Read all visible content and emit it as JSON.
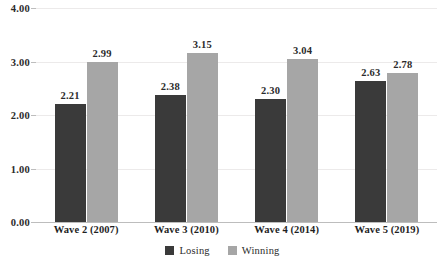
{
  "chart_data": {
    "type": "bar",
    "title": "",
    "subtitle": "",
    "xlabel": "",
    "ylabel": "",
    "ylim": [
      0,
      4
    ],
    "ytick_labels": [
      "0.00",
      "1.00",
      "2.00",
      "3.00",
      "4.00"
    ],
    "ytick_values": [
      0,
      1,
      2,
      3,
      4
    ],
    "grid": true,
    "grid_axis": "y",
    "legend_position": "bottom-center",
    "categories": [
      "Wave 2 (2007)",
      "Wave 3 (2010)",
      "Wave 4 (2014)",
      "Wave 5 (2019)"
    ],
    "series": [
      {
        "name": "Losing",
        "color": "#3a3a3a",
        "values": [
          2.21,
          2.38,
          2.3,
          2.63
        ],
        "labels": [
          "2.21",
          "2.38",
          "2.30",
          "2.63"
        ]
      },
      {
        "name": "Winning",
        "color": "#a6a6a6",
        "values": [
          2.99,
          3.15,
          3.04,
          2.78
        ],
        "labels": [
          "2.99",
          "3.15",
          "3.04",
          "2.78"
        ]
      }
    ]
  },
  "axes": {
    "y_ticks": [
      {
        "label": "4.00",
        "value": 4
      },
      {
        "label": "3.00",
        "value": 3
      },
      {
        "label": "2.00",
        "value": 2
      },
      {
        "label": "1.00",
        "value": 1
      },
      {
        "label": "0.00",
        "value": 0
      }
    ],
    "x_ticks": [
      {
        "label": "Wave 2 (2007)"
      },
      {
        "label": "Wave 3 (2010)"
      },
      {
        "label": "Wave 4 (2014)"
      },
      {
        "label": "Wave 5 (2019)"
      }
    ]
  },
  "legend": {
    "items": [
      {
        "label": "Losing",
        "color": "#3a3a3a"
      },
      {
        "label": "Winning",
        "color": "#a6a6a6"
      }
    ]
  },
  "colors": {
    "losing": "#3a3a3a",
    "winning": "#a6a6a6",
    "gridline": "#eceaea",
    "axis": "#bdbdbd",
    "text": "#2b2b2b",
    "background": "#ffffff"
  }
}
